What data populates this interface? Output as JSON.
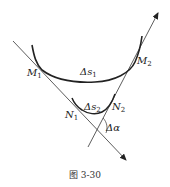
{
  "figure": {
    "caption": "图 3-30",
    "labels": {
      "M1": {
        "main": "M",
        "sub": "1"
      },
      "M2": {
        "main": "M",
        "sub": "2"
      },
      "N1": {
        "main": "N",
        "sub": "1"
      },
      "N2": {
        "main": "N",
        "sub": "2"
      },
      "ds1": {
        "main": "Δs",
        "sub": "1"
      },
      "ds2": {
        "main": "Δs",
        "sub": "2"
      },
      "dalpha": {
        "main": "Δα"
      }
    },
    "colors": {
      "stroke": "#222222",
      "thin_stroke": "#333333"
    }
  }
}
